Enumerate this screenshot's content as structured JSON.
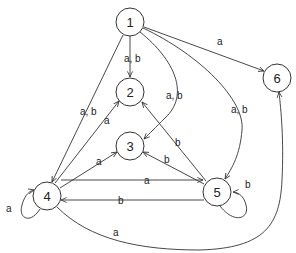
{
  "diagram": {
    "type": "state-transition-graph",
    "nodes": [
      {
        "id": "1",
        "label": "1",
        "x": 130,
        "y": 22
      },
      {
        "id": "2",
        "label": "2",
        "x": 130,
        "y": 92
      },
      {
        "id": "3",
        "label": "3",
        "x": 130,
        "y": 146
      },
      {
        "id": "4",
        "label": "4",
        "x": 47,
        "y": 196
      },
      {
        "id": "5",
        "label": "5",
        "x": 217,
        "y": 192
      },
      {
        "id": "6",
        "label": "6",
        "x": 277,
        "y": 78
      }
    ],
    "edges": [
      {
        "from": "1",
        "to": "2",
        "label": "a, b"
      },
      {
        "from": "1",
        "to": "4",
        "label": "a, b"
      },
      {
        "from": "1",
        "to": "3",
        "label": "a, b"
      },
      {
        "from": "1",
        "to": "5",
        "label": "a, b"
      },
      {
        "from": "1",
        "to": "6",
        "label": "a"
      },
      {
        "from": "4",
        "to": "2",
        "label": "a"
      },
      {
        "from": "4",
        "to": "3",
        "label": "a"
      },
      {
        "from": "4",
        "to": "5",
        "label": "a"
      },
      {
        "from": "5",
        "to": "4",
        "label": "b"
      },
      {
        "from": "5",
        "to": "2",
        "label": "b"
      },
      {
        "from": "5",
        "to": "3",
        "label": "b"
      },
      {
        "from": "4",
        "to": "4",
        "label": "a"
      },
      {
        "from": "5",
        "to": "5",
        "label": "b"
      },
      {
        "from": "4",
        "to": "6",
        "label": "a"
      }
    ]
  }
}
